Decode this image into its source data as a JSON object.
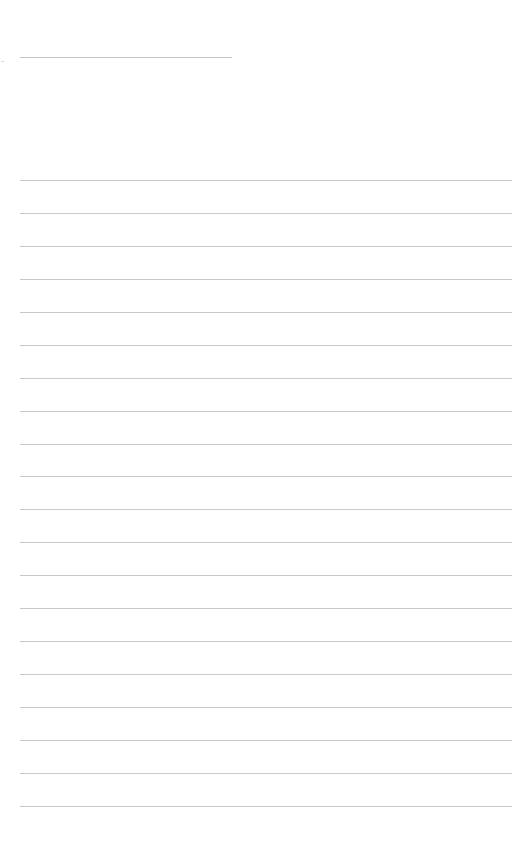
{
  "document": {
    "type": "blank ruled page",
    "header_line": {
      "x": 20,
      "y": 57,
      "width": 212
    },
    "ruled_lines": {
      "count": 20,
      "x": 20,
      "width": 492,
      "positions_y": [
        180,
        213,
        246,
        279,
        312,
        345,
        378,
        411,
        444,
        476,
        509,
        542,
        575,
        608,
        641,
        674,
        707,
        740,
        773,
        806
      ]
    },
    "line_color": "#c8c8c8",
    "background_color": "#ffffff"
  }
}
